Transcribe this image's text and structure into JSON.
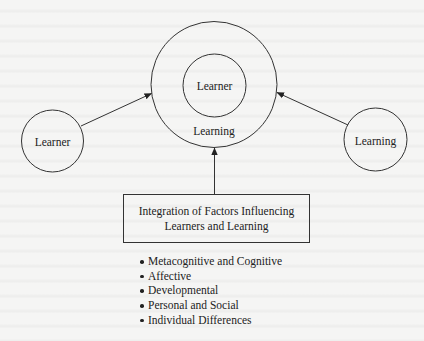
{
  "diagram": {
    "center_node": {
      "inner_label": "Learner",
      "outer_label": "Learning"
    },
    "left_node": {
      "label": "Learner"
    },
    "right_node": {
      "label": "Learning"
    },
    "factors_box": {
      "title_line1": "Integration of Factors Influencing",
      "title_line2": "Learners and Learning"
    },
    "factors": [
      "Metacognitive and Cognitive",
      "Affective",
      "Developmental",
      "Personal and Social",
      "Individual Differences"
    ],
    "edges": [
      {
        "from": "left_node",
        "to": "center_node"
      },
      {
        "from": "right_node",
        "to": "center_node"
      },
      {
        "from": "factors_box",
        "to": "center_node"
      }
    ],
    "colors": {
      "stroke": "#333333",
      "text": "#222222",
      "background": "#f5f5f4"
    }
  }
}
